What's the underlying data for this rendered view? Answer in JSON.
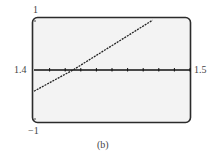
{
  "chart_data": {
    "type": "line",
    "title": "",
    "caption": "(b)",
    "xlabel": "",
    "ylabel": "",
    "xlim": [
      1.4,
      1.5
    ],
    "ylim": [
      -1,
      1
    ],
    "x_tick_labels": {
      "left": "1.4",
      "right": "1.5"
    },
    "y_tick_labels": {
      "top": "1",
      "bottom": "-1"
    },
    "x_tick_count": 10,
    "x_tick_step": 0.01,
    "grid": false,
    "legend": null,
    "series": [
      {
        "name": "graph",
        "style": "dotted",
        "x": [
          1.4,
          1.425,
          1.476
        ],
        "y": [
          -0.4,
          0.0,
          0.94
        ]
      }
    ],
    "x_intercept_approx": 1.425
  },
  "colors": {
    "frame": "#2b2b2b",
    "screen_bg": "#f3f3f3",
    "line": "#222222",
    "axis": "#111111"
  },
  "labels": {
    "y_top": "1",
    "y_bottom": "−1",
    "x_left": "1.4",
    "x_right": "1.5",
    "caption": "(b)"
  }
}
